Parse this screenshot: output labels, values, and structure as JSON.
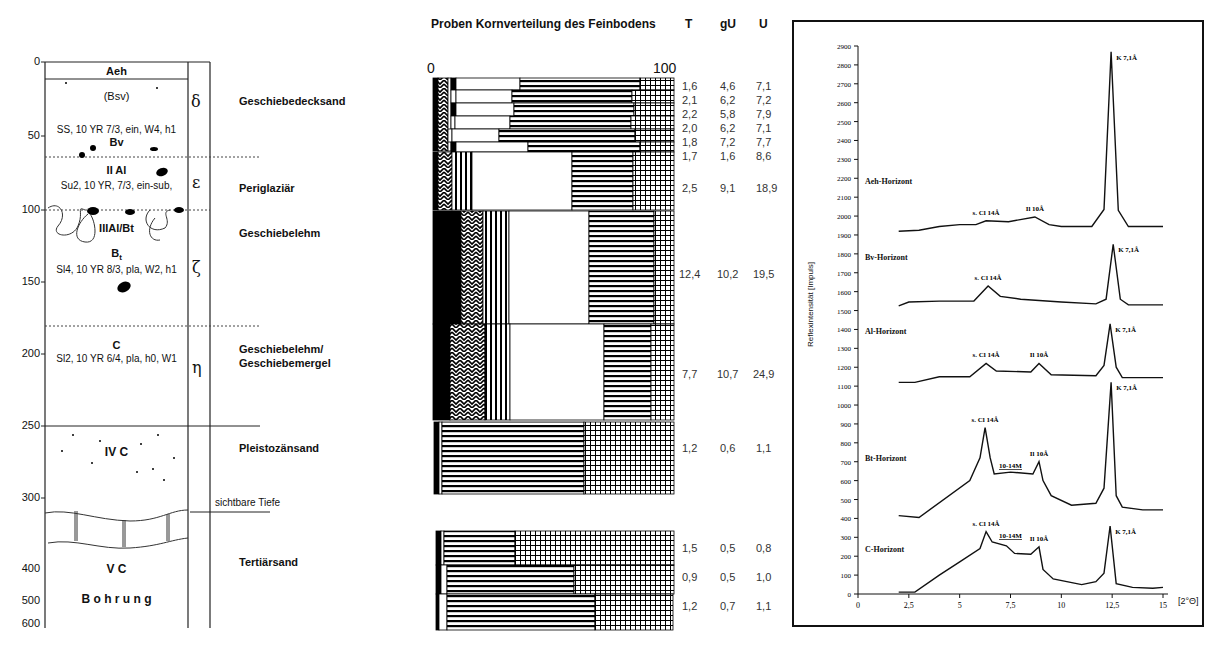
{
  "profile": {
    "depth_ticks": [
      {
        "label": "0",
        "y": 62
      },
      {
        "label": "50",
        "y": 136
      },
      {
        "label": "100",
        "y": 210
      },
      {
        "label": "150",
        "y": 282
      },
      {
        "label": "200",
        "y": 354
      },
      {
        "label": "250",
        "y": 426
      },
      {
        "label": "300",
        "y": 498
      },
      {
        "label": "400",
        "y": 569
      },
      {
        "label": "500",
        "y": 601
      },
      {
        "label": "600",
        "y": 624
      }
    ],
    "horizons": {
      "aeh": "Aeh",
      "bsv": "(Bsv)",
      "bsv_desc": "SS, 10 YR 7/3, ein, W4, h1",
      "bv": "Bv",
      "iial": "II Al",
      "iial_desc": "Su2, 10 YR, 7/3, ein-sub,",
      "iiialbt": "IIIAl/Bt",
      "bt": "B",
      "bt_sub": "t",
      "bt_desc": "Sl4, 10 YR 8/3, pla, W2, h1",
      "c": "C",
      "c_desc": "Sl2, 10 YR 6/4, pla, h0, W1",
      "ivc": "IV C",
      "vc": "V C",
      "bohrung": "B o h r u n g"
    },
    "greek": {
      "delta": "δ",
      "epsilon": "ε",
      "zeta": "ζ",
      "eta": "η"
    },
    "strata": {
      "s1": "Geschiebedecksand",
      "s2": "Periglaziär",
      "s3": "Geschiebelehm",
      "s4a": "Geschiebelehm/",
      "s4b": "Geschiebemergel",
      "s5": "Pleistozänsand",
      "visible_depth": "sichtbare Tiefe",
      "s6": "Tertiärsand"
    }
  },
  "grain": {
    "title": "Proben Kornverteilung des Feinbodens",
    "columns": [
      "T",
      "gU",
      "U"
    ],
    "axis_min": "0",
    "axis_max": "100",
    "rows": [
      {
        "T": "1,6",
        "gU": "4,6",
        "U": "7,1"
      },
      {
        "T": "2,1",
        "gU": "6,2",
        "U": "7,2"
      },
      {
        "T": "2,2",
        "gU": "5,8",
        "U": "7,9"
      },
      {
        "T": "2,0",
        "gU": "6,2",
        "U": "7,1"
      },
      {
        "T": "1,8",
        "gU": "7,2",
        "U": "7,7"
      },
      {
        "T": "1,7",
        "gU": "1,6",
        "U": "8,6"
      },
      {
        "T": "2,5",
        "gU": "9,1",
        "U": "18,9"
      },
      {
        "T": "12,4",
        "gU": "10,2",
        "U": "19,5"
      },
      {
        "T": "7,7",
        "gU": "10,7",
        "U": "24,9"
      },
      {
        "T": "1,2",
        "gU": "0,6",
        "U": "1,1"
      },
      {
        "T": "1,5",
        "gU": "0,5",
        "U": "0,8"
      },
      {
        "T": "0,9",
        "gU": "0,5",
        "U": "1,0"
      },
      {
        "T": "1,2",
        "gU": "0,7",
        "U": "1,1"
      }
    ]
  },
  "chart_data": {
    "type": "line",
    "title": "",
    "xlabel": "[2°Θ]",
    "ylabel": "Reflexintensität [Impuls]",
    "xlim": [
      0,
      15
    ],
    "ylim": [
      0,
      2900
    ],
    "x_ticks": [
      "0",
      "2,5",
      "5",
      "7,5",
      "10",
      "12,5",
      "15"
    ],
    "y_ticks": [
      "0",
      "100",
      "200",
      "300",
      "400",
      "500",
      "600",
      "700",
      "800",
      "900",
      "1000",
      "1100",
      "1200",
      "1300",
      "1400",
      "1500",
      "1600",
      "1700",
      "1800",
      "1900",
      "2000",
      "2100",
      "2200",
      "2300",
      "2400",
      "2500",
      "2600",
      "2700",
      "2800",
      "2900"
    ],
    "grid": false,
    "series": [
      {
        "name": "Aeh-Horizont",
        "x": [
          2,
          3,
          4,
          5,
          5.8,
          6.3,
          7.4,
          8.7,
          9.4,
          10,
          11.5,
          12.1,
          12.45,
          12.8,
          13.3,
          15
        ],
        "y": [
          1920,
          1925,
          1945,
          1955,
          1955,
          1975,
          1970,
          1995,
          1955,
          1945,
          1945,
          2035,
          2870,
          2030,
          1945,
          1945
        ],
        "annotations": [
          {
            "text": "s. Cl 14Å",
            "x": 6.3,
            "y": 1975
          },
          {
            "text": "Il 10Å",
            "x": 8.7,
            "y": 1995
          },
          {
            "text": "K 7,1Å",
            "x": 12.45,
            "y": 2870
          }
        ]
      },
      {
        "name": "Bv-Horizont",
        "x": [
          2,
          2.5,
          4,
          5.7,
          6.4,
          7,
          8,
          10,
          11.7,
          12.2,
          12.55,
          12.9,
          13.3,
          15
        ],
        "y": [
          1525,
          1545,
          1550,
          1550,
          1630,
          1575,
          1560,
          1545,
          1535,
          1560,
          1850,
          1560,
          1530,
          1530
        ],
        "annotations": [
          {
            "text": "s. Cl 14Å",
            "x": 6.4,
            "y": 1630
          },
          {
            "text": "K 7,1Å",
            "x": 12.55,
            "y": 1850
          }
        ]
      },
      {
        "name": "Al-Horizont",
        "x": [
          2,
          2.8,
          4,
          5.5,
          6.3,
          6.8,
          8.5,
          8.9,
          9.5,
          11.7,
          12.1,
          12.4,
          12.7,
          13,
          15
        ],
        "y": [
          1120,
          1120,
          1150,
          1150,
          1220,
          1180,
          1175,
          1220,
          1160,
          1155,
          1210,
          1430,
          1200,
          1145,
          1145
        ],
        "annotations": [
          {
            "text": "s. Cl 14Å",
            "x": 6.3,
            "y": 1220
          },
          {
            "text": "Il 10Å",
            "x": 8.9,
            "y": 1220
          },
          {
            "text": "K 7,1Å",
            "x": 12.4,
            "y": 1430
          }
        ]
      },
      {
        "name": "Bt-Horizont",
        "x": [
          2,
          3,
          5.5,
          6,
          6.25,
          6.5,
          6.7,
          7.5,
          8.6,
          8.9,
          9.1,
          9.5,
          10.5,
          11.7,
          12.1,
          12.45,
          12.7,
          13,
          14,
          15
        ],
        "y": [
          415,
          405,
          600,
          720,
          880,
          720,
          635,
          645,
          635,
          700,
          600,
          520,
          470,
          480,
          560,
          1120,
          520,
          460,
          445,
          445
        ],
        "annotations": [
          {
            "text": "s. Cl 14Å",
            "x": 6.25,
            "y": 880
          },
          {
            "text": "10-14M",
            "x": 7.5,
            "y": 645
          },
          {
            "text": "Il 10Å",
            "x": 8.9,
            "y": 700
          },
          {
            "text": "K 7,1Å",
            "x": 12.45,
            "y": 1120
          }
        ]
      },
      {
        "name": "C-Horizont",
        "x": [
          2,
          2.8,
          4,
          5,
          6,
          6.3,
          6.6,
          7.3,
          7.7,
          8.5,
          8.9,
          9.1,
          9.6,
          11,
          11.7,
          12.1,
          12.4,
          12.7,
          13.5,
          14.5,
          15
        ],
        "y": [
          10,
          10,
          100,
          170,
          240,
          330,
          275,
          255,
          215,
          210,
          250,
          130,
          80,
          50,
          65,
          110,
          360,
          55,
          35,
          30,
          35
        ],
        "annotations": [
          {
            "text": "s. Cl 14Å",
            "x": 6.3,
            "y": 330
          },
          {
            "text": "10-14M",
            "x": 7.5,
            "y": 275
          },
          {
            "text": "Il 10Å",
            "x": 8.9,
            "y": 250
          },
          {
            "text": "K 7,1Å",
            "x": 12.4,
            "y": 360
          }
        ]
      }
    ]
  },
  "xrd_labels": {
    "aeh": "Aeh-Horizont",
    "bv": "Bv-Horizont",
    "al": "Al-Horizont",
    "bt": "Bt-Horizont",
    "c": "C-Horizont",
    "clay": "s. Cl 14Å",
    "illite": "Il 10Å",
    "kaolinite": "K 7,1Å",
    "mixed": "10-14M",
    "xunit": "[2°Θ]",
    "ylabel": "Reflexintensität [Impuls]"
  }
}
